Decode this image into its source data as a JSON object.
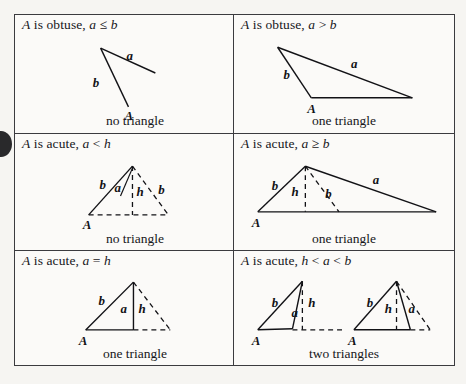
{
  "page": {
    "background_color": "#f6f5f2",
    "table_border_color": "#3b3b3f",
    "ink_color": "#121216",
    "punch_mark_color": "#17171a"
  },
  "table": {
    "rows": 3,
    "columns": 2,
    "cells": [
      {
        "id": "cell-1",
        "position": "row1-left",
        "condition": "A is obtuse, a ≤ b",
        "condition_parts": {
          "vertex": "A",
          "descriptor": "is obtuse,",
          "relation": "a ≤ b"
        },
        "caption": "no triangle",
        "figure": {
          "name": "obtuse-a-le-b-open-figure",
          "description": "Two rays from a common upper-left vertex; side b descends to labeled point A, side a extends right and does not reach the base.",
          "labels": [
            "a",
            "b",
            "A"
          ],
          "closed": false
        }
      },
      {
        "id": "cell-2",
        "position": "row1-right",
        "condition": "A is obtuse, a > b",
        "condition_parts": {
          "vertex": "A",
          "descriptor": "is obtuse,",
          "relation": "a > b"
        },
        "caption": "one triangle",
        "figure": {
          "name": "obtuse-a-gt-b-triangle",
          "description": "Single closed obtuse triangle with vertex A at lower left of base, side b up to apex, long side a from apex to far right base vertex.",
          "labels": [
            "a",
            "b",
            "A"
          ],
          "closed": true
        }
      },
      {
        "id": "cell-3",
        "position": "row2-left",
        "condition": "A is acute, a < h",
        "condition_parts": {
          "vertex": "A",
          "descriptor": "is acute,",
          "relation": "a < h"
        },
        "caption": "no triangle",
        "figure": {
          "name": "acute-a-lt-h-open-figure",
          "description": "Vertex A at lower left, solid side b rising to apex, dashed altitude h from apex to dashed base, dashed side b to the right, and a short solid segment a from apex that falls short of the base.",
          "labels": [
            "b",
            "a",
            "h",
            "b",
            "A"
          ],
          "closed": false
        }
      },
      {
        "id": "cell-4",
        "position": "row2-right",
        "condition": "A is acute, a ≥ b",
        "condition_parts": {
          "vertex": "A",
          "descriptor": "is acute,",
          "relation": "a ≥ b"
        },
        "caption": "one triangle",
        "figure": {
          "name": "acute-a-ge-b-triangle",
          "description": "Closed triangle with vertex A at lower left, solid side b to apex, solid side a from apex to far right base vertex, dashed altitude h and dashed alternate side b to an interior base point.",
          "labels": [
            "b",
            "h",
            "b",
            "a",
            "A"
          ],
          "closed": true
        }
      },
      {
        "id": "cell-5",
        "position": "row3-left",
        "condition": "A is acute, a = h",
        "condition_parts": {
          "vertex": "A",
          "descriptor": "is acute,",
          "relation": "a = h"
        },
        "caption": "one triangle",
        "figure": {
          "name": "acute-a-eq-h-right-triangle",
          "description": "Right triangle with vertex A at lower left, solid side b to apex, solid vertical side a coinciding with altitude h, dashed mirrored side and dashed base extension to the right.",
          "labels": [
            "b",
            "a",
            "h",
            "A"
          ],
          "closed": true
        }
      },
      {
        "id": "cell-6",
        "position": "row3-right",
        "condition": "A is acute, h < a < b",
        "condition_parts": {
          "vertex": "A",
          "descriptor": "is acute,",
          "relation": "h < a < b"
        },
        "caption": "two triangles",
        "figure": {
          "name": "acute-h-lt-a-lt-b-two-triangles",
          "description": "Two separate triangles, each with vertex A at lower left, solid side b to apex, solid side a from apex down to a base point, dashed altitude h and dashed base extension. In the left figure a lands left of the foot of h; in the right figure a lands right of it.",
          "labels": [
            "b",
            "a",
            "h",
            "A",
            "b",
            "h",
            "a",
            "A"
          ],
          "closed": true,
          "count": 2
        }
      }
    ]
  }
}
